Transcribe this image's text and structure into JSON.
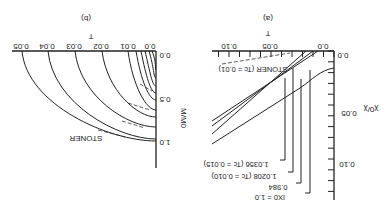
{
  "figure": {
    "orientation": "rotated 180 degrees",
    "panels": [
      {
        "id": "a",
        "label": "(a)",
        "xlabel": "T",
        "ylabel": "χ0/χ",
        "x_ticks": [
          "0.0",
          "0.05",
          "0.10"
        ],
        "y_ticks": [
          "0.0",
          "0.05",
          "0.10"
        ],
        "annotations": {
          "stoner": "STONER (Tc = 0.01)",
          "c1": "IX0 = 1.0",
          "c2": "0.984",
          "c3": "1.0208 (Tc = 0.010)",
          "c4": "1.0356 (Tc = 0.015)"
        }
      },
      {
        "id": "b",
        "label": "(b)",
        "xlabel": "T",
        "ylabel": "M/M0",
        "x_ticks": [
          "0.0",
          "0.01",
          "0.02",
          "0.03",
          "0.04",
          "0.05"
        ],
        "y_ticks": [
          "0.0",
          "0.5",
          "1.0"
        ],
        "annotations": {
          "stoner": "STONER"
        }
      }
    ]
  }
}
